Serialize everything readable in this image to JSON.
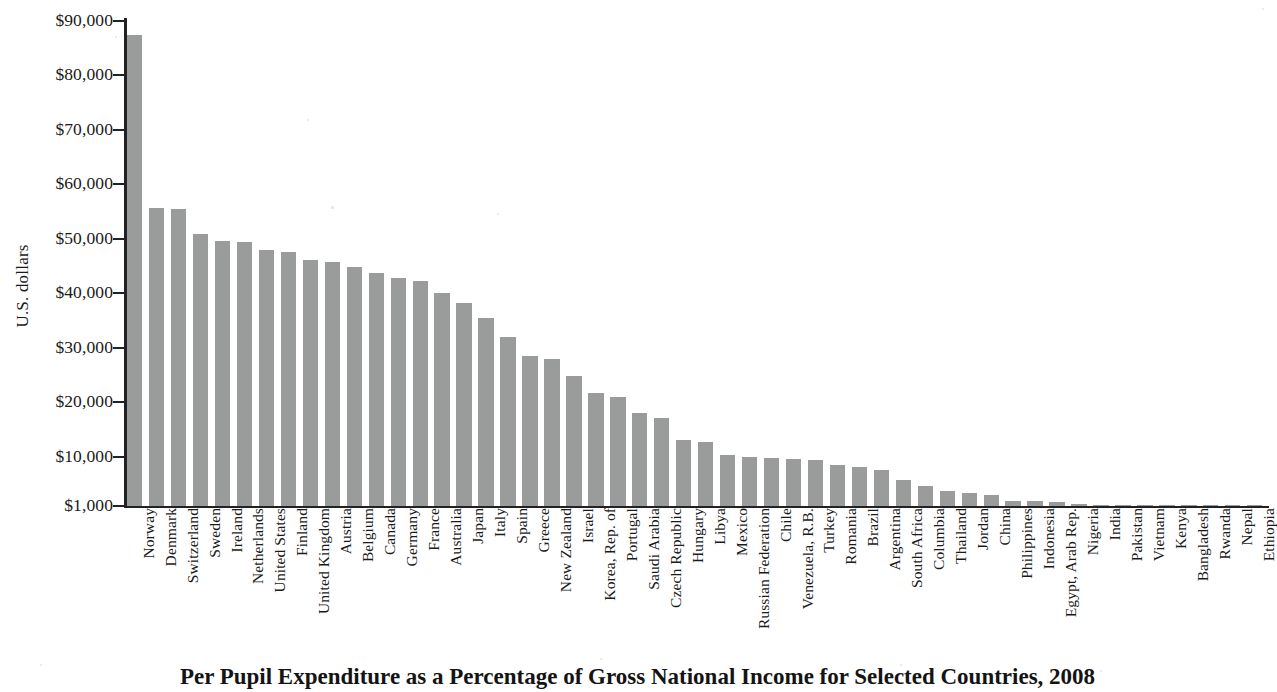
{
  "chart_data": {
    "type": "bar",
    "title": "Per Pupil Expenditure as a Percentage of Gross National Income for Selected Countries, 2008",
    "xlabel": "",
    "ylabel": "U.S. dollars",
    "ylim": [
      1000,
      90000
    ],
    "ytick_labels": [
      "$90,000",
      "$80,000",
      "$70,000",
      "$60,000",
      "$50,000",
      "$40,000",
      "$30,000",
      "$20,000",
      "$10,000",
      "$1,000"
    ],
    "ytick_values": [
      90000,
      80000,
      70000,
      60000,
      50000,
      40000,
      30000,
      20000,
      10000,
      1000
    ],
    "grid": false,
    "legend": false,
    "bar_color": "#9a9b9b",
    "axis_color": "#222222",
    "categories": [
      "Norway",
      "Denmark",
      "Switzerland",
      "Sweden",
      "Ireland",
      "Netherlands",
      "United States",
      "Finland",
      "United Kingdom",
      "Austria",
      "Belgium",
      "Canada",
      "Germany",
      "France",
      "Australia",
      "Japan",
      "Italy",
      "Spain",
      "Greece",
      "New Zealand",
      "Israel",
      "Korea, Rep. of",
      "Portugal",
      "Saudi Arabia",
      "Czech Republic",
      "Hungary",
      "Libya",
      "Mexico",
      "Russian Federation",
      "Chile",
      "Venezuela, R.B.",
      "Turkey",
      "Romania",
      "Brazil",
      "Argentina",
      "South Africa",
      "Columbia",
      "Thailand",
      "Jordan",
      "China",
      "Philippines",
      "Indonesia",
      "Egypt, Arab Rep.",
      "Nigeria",
      "India",
      "Pakistan",
      "Vietnam",
      "Kenya",
      "Bangladesh",
      "Rwanda",
      "Nepal",
      "Ethiopia"
    ],
    "values": [
      87500,
      55700,
      55500,
      50900,
      49700,
      49400,
      47900,
      47600,
      46100,
      45800,
      44800,
      43700,
      42800,
      42200,
      40000,
      38200,
      35500,
      32100,
      28600,
      28000,
      24800,
      21800,
      21000,
      18100,
      17100,
      13200,
      12700,
      10400,
      10000,
      9900,
      9700,
      9400,
      8600,
      8100,
      7600,
      5800,
      4700,
      3700,
      3400,
      3000,
      1900,
      1900,
      1800,
      1400,
      1200,
      1000,
      1000,
      900,
      700,
      500,
      400,
      300
    ]
  }
}
